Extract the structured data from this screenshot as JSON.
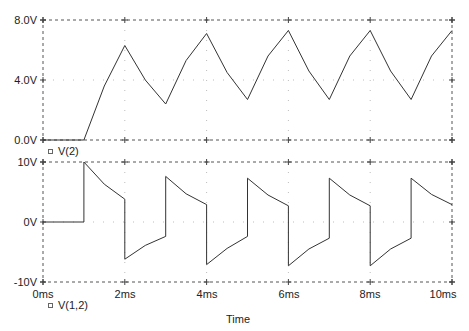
{
  "chart_data": [
    {
      "type": "line",
      "title": "",
      "xlabel": "Time",
      "ylabel": "",
      "xlim": [
        0,
        10
      ],
      "ylim": [
        0,
        8
      ],
      "x_ticks": [
        "0ms",
        "2ms",
        "4ms",
        "6ms",
        "8ms",
        "10ms"
      ],
      "y_ticks": [
        "0.0V",
        "4.0V",
        "8.0V"
      ],
      "legend": [
        "V(2)"
      ],
      "grid": true,
      "series": [
        {
          "name": "V(2)",
          "x": [
            0,
            1.0,
            1.5,
            2.0,
            2.5,
            3.0,
            3.5,
            4.0,
            4.5,
            5.0,
            5.5,
            6.0,
            6.5,
            7.0,
            7.5,
            8.0,
            8.5,
            9.0,
            9.5,
            10.0
          ],
          "values": [
            0,
            0,
            3.6,
            6.3,
            4.0,
            2.4,
            5.3,
            7.1,
            4.5,
            2.7,
            5.6,
            7.3,
            4.6,
            2.7,
            5.6,
            7.3,
            4.6,
            2.7,
            5.6,
            7.3
          ]
        }
      ]
    },
    {
      "type": "line",
      "title": "",
      "xlabel": "Time",
      "ylabel": "",
      "xlim": [
        0,
        10
      ],
      "ylim": [
        -10,
        10
      ],
      "x_ticks": [
        "0ms",
        "2ms",
        "4ms",
        "6ms",
        "8ms",
        "10ms"
      ],
      "y_ticks": [
        "-10V",
        "0V",
        "10V"
      ],
      "legend": [
        "V(1,2)"
      ],
      "grid": true,
      "series": [
        {
          "name": "V(1,2)",
          "x": [
            0,
            1.0,
            1.0,
            1.5,
            2.0,
            2.0,
            2.5,
            3.0,
            3.0,
            3.5,
            4.0,
            4.0,
            4.5,
            5.0,
            5.0,
            5.5,
            6.0,
            6.0,
            6.5,
            7.0,
            7.0,
            7.5,
            8.0,
            8.0,
            8.5,
            9.0,
            9.0,
            9.5,
            10.0
          ],
          "values": [
            0,
            0,
            10,
            6.3,
            3.8,
            -6.2,
            -3.9,
            -2.4,
            7.6,
            4.7,
            2.9,
            -7.1,
            -4.4,
            -2.4,
            7.3,
            4.5,
            2.7,
            -7.3,
            -4.5,
            -2.7,
            7.3,
            4.5,
            2.7,
            -7.3,
            -4.5,
            -2.7,
            7.3,
            4.6,
            2.9
          ]
        }
      ]
    }
  ],
  "panels": {
    "top": {
      "y_tick_labels": [
        "8.0V",
        "4.0V",
        "0.0V"
      ],
      "legend_label": "V(2)"
    },
    "bottom": {
      "y_tick_labels": [
        "10V",
        "0V",
        "-10V"
      ],
      "legend_label": "V(1,2)"
    }
  },
  "x_axis": {
    "tick_labels": [
      "0ms",
      "2ms",
      "4ms",
      "6ms",
      "8ms",
      "10ms"
    ],
    "title": "Time"
  },
  "colors": {
    "trace": "#333333",
    "frame": "#555555",
    "grid": "#bdbdbd",
    "background": "#ffffff"
  }
}
